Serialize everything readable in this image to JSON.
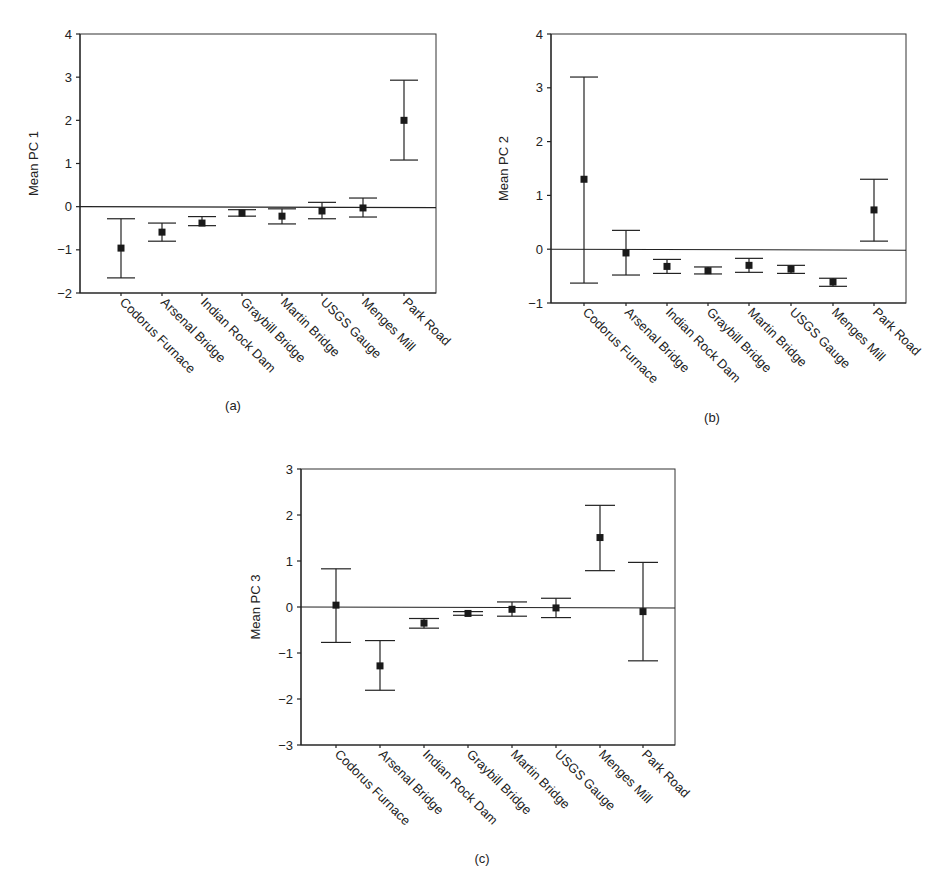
{
  "figure": {
    "panels": [
      "(a)",
      "(b)",
      "(c)"
    ]
  },
  "chart_data": [
    {
      "type": "scatter",
      "subtype": "mean-with-error-bars",
      "panel": "(a)",
      "title": "",
      "xlabel": "",
      "ylabel": "Mean PC 1",
      "ylim": [
        -2,
        4
      ],
      "yticks": [
        -2,
        -1,
        0,
        1,
        2,
        3,
        4
      ],
      "grid": false,
      "reference_line": 0,
      "categories": [
        "Codorus Furnace",
        "Arsenal Bridge",
        "Indian Rock Dam",
        "Graybill Bridge",
        "Martin Bridge",
        "USGS Gauge",
        "Menges Mill",
        "Park Road"
      ],
      "values": [
        -0.96,
        -0.59,
        -0.38,
        -0.15,
        -0.22,
        -0.1,
        -0.03,
        2.0
      ],
      "upper": [
        -0.28,
        -0.38,
        -0.23,
        -0.07,
        -0.05,
        0.1,
        0.2,
        2.93
      ],
      "lower": [
        -1.65,
        -0.8,
        -0.44,
        -0.22,
        -0.4,
        -0.28,
        -0.24,
        1.08
      ]
    },
    {
      "type": "scatter",
      "subtype": "mean-with-error-bars",
      "panel": "(b)",
      "title": "",
      "xlabel": "",
      "ylabel": "Mean PC 2",
      "ylim": [
        -1,
        4
      ],
      "yticks": [
        -1,
        0,
        1,
        2,
        3,
        4
      ],
      "grid": false,
      "reference_line": 0,
      "categories": [
        "Codorus Furnace",
        "Arsenal Bridge",
        "Indian Rock Dam",
        "Graybill Bridge",
        "Martin Bridge",
        "USGS Gauge",
        "Menges Mill",
        "Park Road"
      ],
      "values": [
        1.3,
        -0.07,
        -0.32,
        -0.4,
        -0.3,
        -0.37,
        -0.61,
        0.73
      ],
      "upper": [
        3.2,
        0.35,
        -0.19,
        -0.33,
        -0.17,
        -0.3,
        -0.54,
        1.3
      ],
      "lower": [
        -0.63,
        -0.48,
        -0.45,
        -0.46,
        -0.43,
        -0.45,
        -0.69,
        0.15
      ]
    },
    {
      "type": "scatter",
      "subtype": "mean-with-error-bars",
      "panel": "(c)",
      "title": "",
      "xlabel": "",
      "ylabel": "Mean PC 3",
      "ylim": [
        -3,
        3
      ],
      "yticks": [
        -3,
        -2,
        -1,
        0,
        1,
        2,
        3
      ],
      "grid": false,
      "reference_line": 0,
      "categories": [
        "Codorus Furnace",
        "Arsenal Bridge",
        "Indian Rock Dam",
        "Graybill Bridge",
        "Martin Bridge",
        "USGS Gauge",
        "Menges Mill",
        "Park Road"
      ],
      "values": [
        0.04,
        -1.28,
        -0.35,
        -0.14,
        -0.05,
        -0.02,
        1.51,
        -0.1
      ],
      "upper": [
        0.83,
        -0.73,
        -0.25,
        -0.1,
        0.11,
        0.19,
        2.21,
        0.97
      ],
      "lower": [
        -0.77,
        -1.81,
        -0.46,
        -0.18,
        -0.2,
        -0.23,
        0.79,
        -1.17
      ]
    }
  ]
}
